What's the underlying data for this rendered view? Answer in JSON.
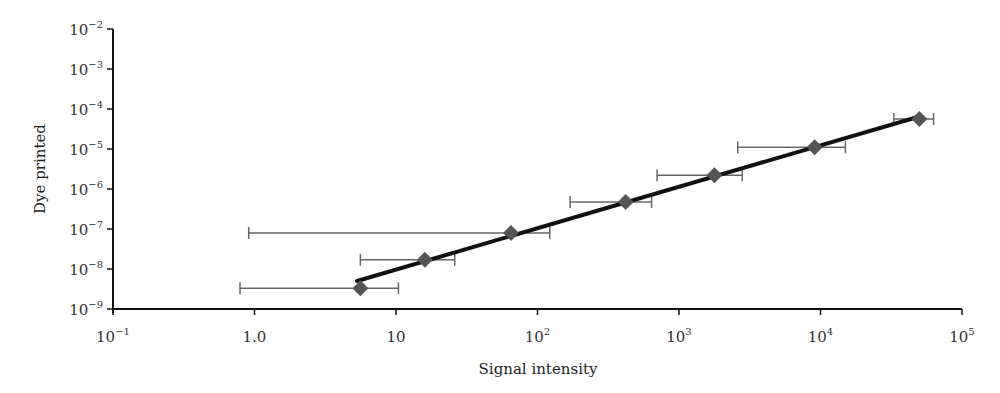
{
  "chart_data": {
    "type": "scatter",
    "title": "",
    "xlabel": "Signal intensity",
    "ylabel": "Dye printed",
    "xscale": "log",
    "yscale": "log",
    "xlim": [
      0.1,
      100000
    ],
    "ylim": [
      1e-09,
      0.01
    ],
    "x_ticks": [
      {
        "value": 0.1,
        "base": "10",
        "exp": "−1"
      },
      {
        "value": 1,
        "base": "1.0",
        "exp": ""
      },
      {
        "value": 10,
        "base": "10",
        "exp": ""
      },
      {
        "value": 100,
        "base": "10",
        "exp": "2"
      },
      {
        "value": 1000,
        "base": "10",
        "exp": "3"
      },
      {
        "value": 10000,
        "base": "10",
        "exp": "4"
      },
      {
        "value": 100000,
        "base": "10",
        "exp": "5"
      }
    ],
    "y_ticks": [
      {
        "value": 1e-09,
        "base": "10",
        "exp": "−9"
      },
      {
        "value": 1e-08,
        "base": "10",
        "exp": "−8"
      },
      {
        "value": 1e-07,
        "base": "10",
        "exp": "−7"
      },
      {
        "value": 1e-06,
        "base": "10",
        "exp": "−6"
      },
      {
        "value": 1e-05,
        "base": "10",
        "exp": "−5"
      },
      {
        "value": 0.0001,
        "base": "10",
        "exp": "−4"
      },
      {
        "value": 0.001,
        "base": "10",
        "exp": "−3"
      },
      {
        "value": 0.01,
        "base": "10",
        "exp": "−2"
      }
    ],
    "grid": false,
    "legend": null,
    "series": [
      {
        "name": "Measured",
        "marker": "diamond",
        "color": "#555555",
        "points": [
          {
            "x": 5.6,
            "y": 3.3e-09,
            "x_err_low": 0.79,
            "x_err_high": 10.4
          },
          {
            "x": 16,
            "y": 1.7e-08,
            "x_err_low": 5.6,
            "x_err_high": 26
          },
          {
            "x": 65,
            "y": 8e-08,
            "x_err_low": 0.91,
            "x_err_high": 122
          },
          {
            "x": 420,
            "y": 4.7e-07,
            "x_err_low": 170,
            "x_err_high": 640
          },
          {
            "x": 1780,
            "y": 2.2e-06,
            "x_err_low": 700,
            "x_err_high": 2800
          },
          {
            "x": 9100,
            "y": 1.1e-05,
            "x_err_low": 2600,
            "x_err_high": 15000
          },
          {
            "x": 50000,
            "y": 5.6e-05,
            "x_err_low": 33000,
            "x_err_high": 63000
          }
        ]
      },
      {
        "name": "Fit",
        "type": "line",
        "color": "#111111",
        "points": [
          {
            "x": 5.3,
            "y": 5e-09
          },
          {
            "x": 50000,
            "y": 6.5e-05
          }
        ]
      }
    ]
  }
}
